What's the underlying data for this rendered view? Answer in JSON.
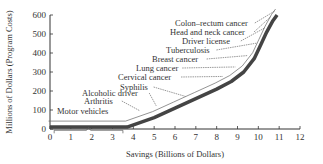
{
  "chart_data": {
    "type": "line",
    "title": "",
    "xlabel": "Savings (Billions of Dollars)",
    "ylabel": "Millions of Dollars (Program Costs)",
    "xlim": [
      0,
      12
    ],
    "ylim": [
      0,
      600
    ],
    "x_ticks": [
      0,
      1,
      2,
      3,
      4,
      5,
      6,
      7,
      8,
      9,
      10,
      11,
      12
    ],
    "y_ticks": [
      0,
      100,
      200,
      300,
      400,
      500,
      600
    ],
    "grid": false,
    "legend": null,
    "series": [
      {
        "name": "Cumulative cost vs savings",
        "x": [
          0,
          3.7,
          5.0,
          6.0,
          7.0,
          8.0,
          8.7,
          9.3,
          9.8,
          10.1,
          10.4,
          10.7,
          10.9
        ],
        "y": [
          10,
          10,
          60,
          110,
          160,
          210,
          250,
          300,
          370,
          440,
          510,
          570,
          600
        ]
      }
    ],
    "annotations": [
      {
        "label": "Motor vehicles",
        "x_range": [
          0.2,
          3.5
        ],
        "y": 30
      },
      {
        "label": "Arthritis",
        "x": 4.3,
        "y": 65
      },
      {
        "label": "Alcoholic driver",
        "x": 5.1,
        "y": 90
      },
      {
        "label": "Syphilis",
        "x": 6.5,
        "y": 140
      },
      {
        "label": "Cervical cancer",
        "x": 8.3,
        "y": 245
      },
      {
        "label": "Lung cancer",
        "x": 8.9,
        "y": 295
      },
      {
        "label": "Breast cancer",
        "x": 9.5,
        "y": 355
      },
      {
        "label": "Tuberculosis",
        "x": 9.9,
        "y": 420
      },
      {
        "label": "Driver license",
        "x": 10.3,
        "y": 500
      },
      {
        "label": "Head and neck cancer",
        "x": 10.6,
        "y": 560
      },
      {
        "label": "Colon–rectum cancer",
        "x": 10.8,
        "y": 590
      }
    ]
  }
}
